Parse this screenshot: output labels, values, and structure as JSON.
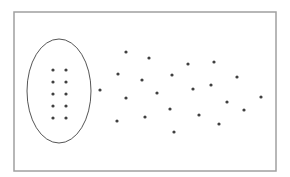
{
  "diagram": {
    "colors": {
      "background": "#ffffff",
      "frame": "#a0a0a0",
      "ellipse": "#555555",
      "dot": "#404040"
    },
    "frame": {
      "x": 14,
      "y": 12,
      "width": 262,
      "height": 159
    },
    "ellipse": {
      "cx": 59,
      "cy": 91,
      "rx": 32,
      "ry": 52
    },
    "dot_radius": 1.6,
    "grouped_points": [
      {
        "x": 53,
        "y": 70
      },
      {
        "x": 66,
        "y": 70
      },
      {
        "x": 53,
        "y": 82
      },
      {
        "x": 66,
        "y": 82
      },
      {
        "x": 53,
        "y": 94
      },
      {
        "x": 66,
        "y": 94
      },
      {
        "x": 53,
        "y": 106
      },
      {
        "x": 66,
        "y": 106
      },
      {
        "x": 53,
        "y": 118
      },
      {
        "x": 66,
        "y": 118
      }
    ],
    "scattered_points": [
      {
        "x": 100,
        "y": 90
      },
      {
        "x": 126,
        "y": 52
      },
      {
        "x": 149,
        "y": 58
      },
      {
        "x": 118,
        "y": 74
      },
      {
        "x": 142,
        "y": 80
      },
      {
        "x": 126,
        "y": 98
      },
      {
        "x": 117,
        "y": 121
      },
      {
        "x": 145,
        "y": 117
      },
      {
        "x": 157,
        "y": 93
      },
      {
        "x": 172,
        "y": 75
      },
      {
        "x": 170,
        "y": 109
      },
      {
        "x": 174,
        "y": 132
      },
      {
        "x": 188,
        "y": 64
      },
      {
        "x": 193,
        "y": 89
      },
      {
        "x": 199,
        "y": 115
      },
      {
        "x": 211,
        "y": 85
      },
      {
        "x": 214,
        "y": 62
      },
      {
        "x": 219,
        "y": 124
      },
      {
        "x": 227,
        "y": 102
      },
      {
        "x": 237,
        "y": 77
      },
      {
        "x": 244,
        "y": 110
      },
      {
        "x": 261,
        "y": 97
      }
    ]
  }
}
